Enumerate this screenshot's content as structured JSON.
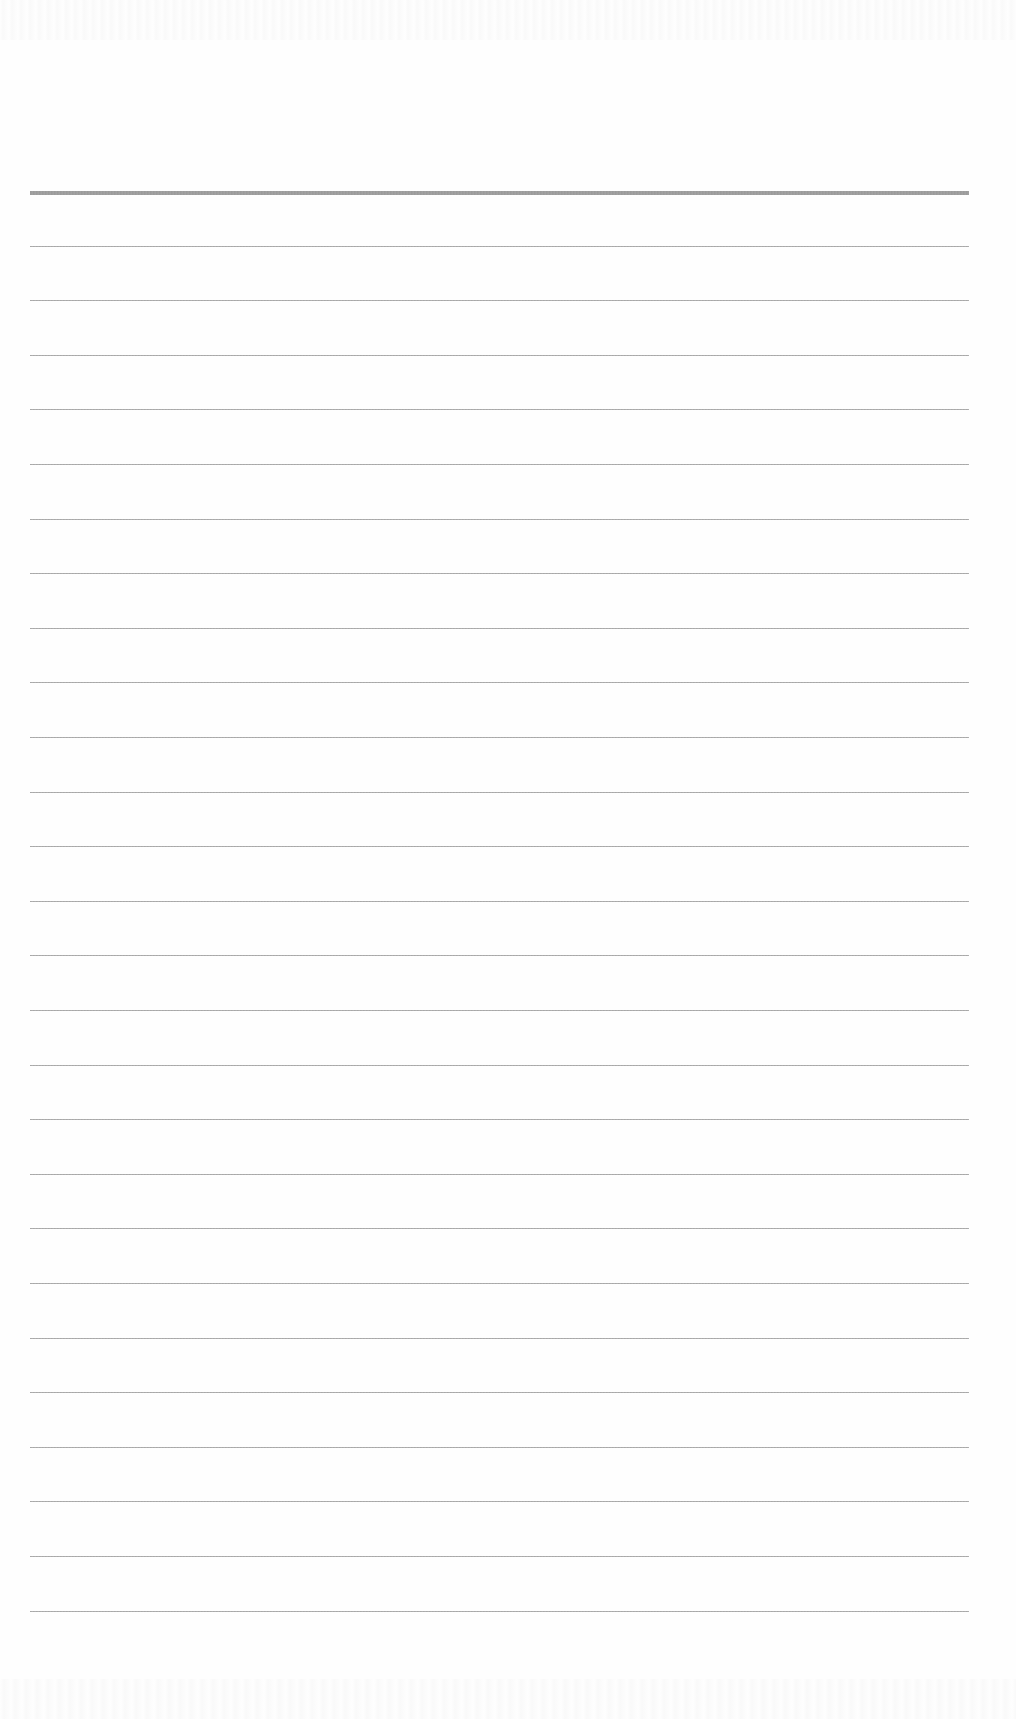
{
  "page": {
    "type": "blank-ruled-sheet",
    "background_color": "#fefefe",
    "line_color": "#a6a6a6",
    "heavy_line_color": "#939393",
    "left_x": 30,
    "right_x": 969,
    "first_line_y": 191,
    "line_spacing": 54.6,
    "line_count": 27,
    "heavy_top_line": true
  }
}
